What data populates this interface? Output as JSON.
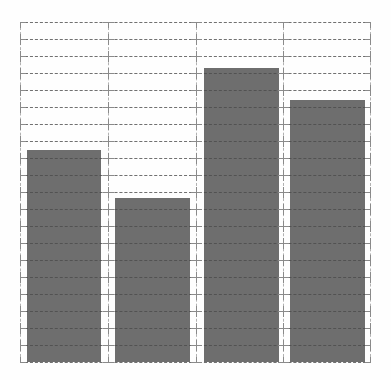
{
  "chart_data": {
    "type": "bar",
    "title": "",
    "subtitle": "",
    "xlabel": "",
    "ylabel": "",
    "categories": [
      "1",
      "2",
      "3",
      "4"
    ],
    "values": [
      12.5,
      9.6,
      17.3,
      15.4
    ],
    "series": [
      {
        "name": "series-1",
        "values": [
          12.5,
          9.6,
          17.3,
          15.4
        ]
      }
    ],
    "xlim": [
      0,
      4
    ],
    "ylim": [
      0,
      20
    ],
    "grid": true,
    "grid_style": "dashed",
    "legend": false,
    "legend_position": "none",
    "tick_labels_x": [],
    "tick_labels_y": [],
    "annotations": [],
    "bar_color": "#6e6e6e",
    "grid_color": "#b2b2b2",
    "tick_color": "#8a8a8a",
    "background_color": "#fefefe",
    "y_major_interval": 1,
    "y_major_count": 20,
    "x_major_count": 4,
    "bar_width_fraction": 0.84
  },
  "figure": {
    "width": 391,
    "height": 380,
    "plot_left": 20,
    "plot_top": 22,
    "plot_width": 351,
    "plot_height": 340
  },
  "bars": [
    {
      "name": "bar-1",
      "value": 12.5,
      "top_px": 150,
      "left_px": 27,
      "width_px": 74
    },
    {
      "name": "bar-2",
      "value": 9.6,
      "top_px": 198,
      "left_px": 115,
      "width_px": 75
    },
    {
      "name": "bar-3",
      "value": 17.3,
      "top_px": 68,
      "left_px": 204,
      "width_px": 75
    },
    {
      "name": "bar-4",
      "value": 15.4,
      "top_px": 100,
      "left_px": 290,
      "width_px": 75
    }
  ]
}
